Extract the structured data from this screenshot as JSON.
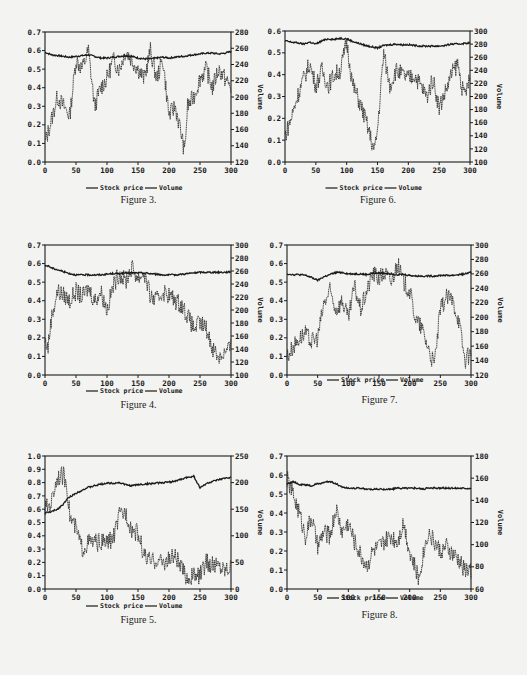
{
  "page": {
    "type": "scanned journal page with six dual-axis figures"
  },
  "legend": {
    "price_label": "Stock price",
    "volume_label": "Volume"
  },
  "figures": [
    {
      "id": "fig3",
      "caption": "Figure 3.",
      "left_ticks": [
        "0.0",
        "0.1",
        "0.2",
        "0.3",
        "0.4",
        "0.5",
        "0.6",
        "0.7"
      ],
      "right_ticks": [
        "120",
        "140",
        "160",
        "180",
        "200",
        "220",
        "240",
        "260",
        "280"
      ],
      "x_ticks": [
        "0",
        "50",
        "100",
        "150",
        "200",
        "250",
        "300"
      ],
      "right_axis_title": "Volume"
    },
    {
      "id": "fig6",
      "caption": "Figure 6.",
      "left_ticks": [
        "0.0",
        "0.1",
        "0.2",
        "0.3",
        "0.4",
        "0.5",
        "0.6"
      ],
      "right_ticks": [
        "100",
        "120",
        "140",
        "160",
        "180",
        "200",
        "220",
        "240",
        "260",
        "280",
        "300"
      ],
      "x_ticks": [
        "0",
        "50",
        "100",
        "150",
        "200",
        "250",
        "300"
      ],
      "right_axis_title": "Volume"
    },
    {
      "id": "fig4",
      "caption": "Figure 4.",
      "left_ticks": [
        "0.0",
        "0.1",
        "0.2",
        "0.3",
        "0.4",
        "0.5",
        "0.6",
        "0.7"
      ],
      "right_ticks": [
        "100",
        "120",
        "140",
        "160",
        "180",
        "200",
        "220",
        "240",
        "260",
        "280",
        "300"
      ],
      "x_ticks": [
        "0",
        "50",
        "100",
        "150",
        "200",
        "250",
        "300"
      ],
      "right_axis_title": "Volume"
    },
    {
      "id": "fig7",
      "caption": "Figure 7.",
      "left_ticks": [
        "0.0",
        "0.1",
        "0.2",
        "0.3",
        "0.4",
        "0.5",
        "0.6",
        "0.7"
      ],
      "right_ticks": [
        "120",
        "140",
        "160",
        "180",
        "200",
        "220",
        "240",
        "260",
        "280",
        "300"
      ],
      "x_ticks": [
        "0",
        "50",
        "100",
        "150",
        "200",
        "250",
        "300"
      ],
      "right_axis_title": "Volume"
    },
    {
      "id": "fig5",
      "caption": "Figure 5.",
      "left_ticks": [
        "0.0",
        "0.1",
        "0.2",
        "0.3",
        "0.4",
        "0.5",
        "0.6",
        "0.7",
        "0.8",
        "0.9",
        "1.0"
      ],
      "right_ticks": [
        "0",
        "50",
        "100",
        "150",
        "200",
        "250"
      ],
      "x_ticks": [
        "0",
        "50",
        "100",
        "150",
        "200",
        "250",
        "300"
      ],
      "right_axis_title": "Volume"
    },
    {
      "id": "fig8",
      "caption": "Figure 8.",
      "left_ticks": [
        "0.0",
        "0.1",
        "0.2",
        "0.3",
        "0.4",
        "0.5",
        "0.6",
        "0.7"
      ],
      "right_ticks": [
        "60",
        "80",
        "100",
        "120",
        "140",
        "160",
        "180"
      ],
      "x_ticks": [
        "0",
        "50",
        "100",
        "150",
        "200",
        "250",
        "300"
      ],
      "right_axis_title": "Volume"
    }
  ],
  "chart_data": [
    {
      "type": "line",
      "title": "Figure 3.",
      "xlabel": "",
      "ylabel": "",
      "y2label": "Volume",
      "xlim": [
        0,
        300
      ],
      "ylim": [
        0,
        0.7
      ],
      "y2lim": [
        120,
        280
      ],
      "grid": false,
      "legend_position": "bottom",
      "x": [
        0,
        10,
        20,
        30,
        40,
        50,
        60,
        70,
        80,
        90,
        100,
        110,
        120,
        130,
        140,
        150,
        160,
        170,
        180,
        190,
        200,
        210,
        220,
        225,
        230,
        240,
        250,
        260,
        270,
        280,
        290,
        300
      ],
      "series": [
        {
          "name": "Stock price",
          "axis": "left",
          "values": [
            0.1,
            0.22,
            0.35,
            0.3,
            0.25,
            0.55,
            0.5,
            0.6,
            0.3,
            0.4,
            0.45,
            0.55,
            0.5,
            0.6,
            0.55,
            0.5,
            0.45,
            0.6,
            0.45,
            0.55,
            0.25,
            0.3,
            0.15,
            0.05,
            0.3,
            0.35,
            0.45,
            0.5,
            0.4,
            0.5,
            0.45,
            0.4
          ]
        },
        {
          "name": "Volume",
          "axis": "right",
          "values": [
            255,
            252,
            251,
            250,
            249,
            250,
            251,
            252,
            250,
            248,
            248,
            249,
            250,
            251,
            250,
            248,
            247,
            247,
            248,
            249,
            248,
            249,
            250,
            250,
            251,
            252,
            253,
            254,
            254,
            253,
            254,
            256
          ]
        }
      ]
    },
    {
      "type": "line",
      "title": "Figure 6.",
      "xlabel": "",
      "ylabel": "",
      "y2label": "Volume",
      "xlim": [
        0,
        300
      ],
      "ylim": [
        0,
        0.6
      ],
      "y2lim": [
        100,
        300
      ],
      "grid": false,
      "legend_position": "bottom",
      "x": [
        0,
        10,
        20,
        30,
        40,
        50,
        60,
        70,
        80,
        90,
        100,
        110,
        120,
        130,
        140,
        145,
        150,
        160,
        170,
        180,
        190,
        200,
        210,
        220,
        230,
        240,
        250,
        260,
        270,
        280,
        290,
        300
      ],
      "series": [
        {
          "name": "Stock price",
          "axis": "left",
          "values": [
            0.12,
            0.2,
            0.3,
            0.38,
            0.45,
            0.35,
            0.42,
            0.35,
            0.4,
            0.42,
            0.55,
            0.35,
            0.28,
            0.2,
            0.1,
            0.05,
            0.15,
            0.5,
            0.35,
            0.42,
            0.4,
            0.38,
            0.4,
            0.35,
            0.3,
            0.38,
            0.25,
            0.32,
            0.4,
            0.45,
            0.3,
            0.38
          ]
        },
        {
          "name": "Volume",
          "axis": "right",
          "values": [
            285,
            283,
            282,
            280,
            283,
            280,
            285,
            288,
            287,
            289,
            288,
            284,
            281,
            278,
            276,
            275,
            274,
            278,
            279,
            280,
            279,
            279,
            278,
            277,
            277,
            277,
            277,
            278,
            280,
            280,
            281,
            282
          ]
        }
      ]
    },
    {
      "type": "line",
      "title": "Figure 4.",
      "xlabel": "",
      "ylabel": "",
      "y2label": "Volume",
      "xlim": [
        0,
        300
      ],
      "ylim": [
        0,
        0.7
      ],
      "y2lim": [
        100,
        300
      ],
      "grid": false,
      "legend_position": "bottom",
      "x": [
        0,
        5,
        10,
        20,
        30,
        40,
        50,
        60,
        70,
        80,
        90,
        100,
        110,
        120,
        130,
        140,
        150,
        160,
        170,
        180,
        190,
        200,
        210,
        220,
        230,
        240,
        250,
        260,
        270,
        280,
        290,
        300
      ],
      "series": [
        {
          "name": "Stock price",
          "axis": "left",
          "values": [
            0.18,
            0.15,
            0.3,
            0.45,
            0.43,
            0.4,
            0.45,
            0.42,
            0.47,
            0.4,
            0.45,
            0.35,
            0.48,
            0.55,
            0.5,
            0.58,
            0.52,
            0.55,
            0.42,
            0.4,
            0.45,
            0.43,
            0.4,
            0.38,
            0.32,
            0.25,
            0.28,
            0.25,
            0.15,
            0.1,
            0.12,
            0.15
          ]
        },
        {
          "name": "Volume",
          "axis": "right",
          "values": [
            268,
            268,
            265,
            262,
            259,
            256,
            254,
            254,
            254,
            254,
            254,
            255,
            256,
            256,
            257,
            257,
            257,
            257,
            256,
            255,
            254,
            254,
            254,
            255,
            256,
            257,
            258,
            258,
            258,
            258,
            258,
            259
          ]
        }
      ]
    },
    {
      "type": "line",
      "title": "Figure 7.",
      "xlabel": "",
      "ylabel": "",
      "y2label": "Volume",
      "xlim": [
        0,
        300
      ],
      "ylim": [
        0,
        0.7
      ],
      "y2lim": [
        120,
        300
      ],
      "grid": false,
      "legend_position": "bottom",
      "x": [
        0,
        10,
        20,
        30,
        40,
        50,
        60,
        70,
        80,
        90,
        100,
        110,
        120,
        130,
        140,
        150,
        160,
        170,
        180,
        190,
        200,
        210,
        220,
        230,
        240,
        250,
        260,
        270,
        280,
        290,
        300
      ],
      "series": [
        {
          "name": "Stock price",
          "axis": "left",
          "values": [
            0.1,
            0.15,
            0.2,
            0.22,
            0.18,
            0.2,
            0.38,
            0.45,
            0.35,
            0.4,
            0.3,
            0.48,
            0.35,
            0.45,
            0.55,
            0.52,
            0.55,
            0.5,
            0.6,
            0.5,
            0.45,
            0.3,
            0.25,
            0.15,
            0.05,
            0.35,
            0.42,
            0.4,
            0.3,
            0.08,
            0.12
          ]
        },
        {
          "name": "Volume",
          "axis": "right",
          "values": [
            260,
            259,
            259,
            258,
            255,
            251,
            256,
            259,
            262,
            262,
            260,
            260,
            260,
            259,
            261,
            261,
            261,
            260,
            259,
            259,
            258,
            257,
            257,
            257,
            257,
            258,
            258,
            258,
            259,
            260,
            262
          ]
        }
      ]
    },
    {
      "type": "line",
      "title": "Figure 5.",
      "xlabel": "",
      "ylabel": "",
      "y2label": "Volume",
      "xlim": [
        0,
        300
      ],
      "ylim": [
        0,
        1.0
      ],
      "y2lim": [
        0,
        250
      ],
      "grid": false,
      "legend_position": "bottom",
      "x": [
        0,
        10,
        20,
        30,
        35,
        40,
        50,
        60,
        70,
        80,
        90,
        100,
        110,
        120,
        130,
        140,
        150,
        160,
        170,
        180,
        190,
        200,
        210,
        220,
        230,
        240,
        250,
        260,
        270,
        280,
        290,
        300
      ],
      "series": [
        {
          "name": "Stock price",
          "axis": "left",
          "values": [
            0.6,
            0.65,
            0.85,
            0.85,
            0.8,
            0.55,
            0.45,
            0.3,
            0.35,
            0.35,
            0.35,
            0.35,
            0.38,
            0.55,
            0.58,
            0.45,
            0.42,
            0.25,
            0.2,
            0.22,
            0.2,
            0.22,
            0.25,
            0.15,
            0.08,
            0.1,
            0.1,
            0.2,
            0.18,
            0.18,
            0.15,
            0.18
          ]
        },
        {
          "name": "Volume",
          "axis": "right",
          "values": [
            143,
            145,
            150,
            160,
            168,
            173,
            180,
            186,
            191,
            194,
            197,
            199,
            199,
            200,
            196,
            194,
            196,
            197,
            198,
            199,
            200,
            201,
            203,
            206,
            210,
            212,
            190,
            198,
            202,
            205,
            208,
            210
          ]
        }
      ]
    },
    {
      "type": "line",
      "title": "Figure 8.",
      "xlabel": "",
      "ylabel": "",
      "y2label": "Volume",
      "xlim": [
        0,
        300
      ],
      "ylim": [
        0,
        0.7
      ],
      "y2lim": [
        60,
        180
      ],
      "grid": false,
      "legend_position": "bottom",
      "x": [
        0,
        10,
        20,
        30,
        40,
        50,
        60,
        70,
        80,
        90,
        100,
        110,
        120,
        130,
        140,
        150,
        160,
        170,
        180,
        190,
        200,
        210,
        215,
        220,
        230,
        240,
        250,
        260,
        270,
        280,
        290,
        300
      ],
      "series": [
        {
          "name": "Stock price",
          "axis": "left",
          "values": [
            0.58,
            0.5,
            0.4,
            0.28,
            0.38,
            0.22,
            0.3,
            0.28,
            0.42,
            0.3,
            0.35,
            0.25,
            0.18,
            0.12,
            0.2,
            0.22,
            0.25,
            0.28,
            0.25,
            0.35,
            0.2,
            0.1,
            0.05,
            0.15,
            0.3,
            0.25,
            0.2,
            0.22,
            0.18,
            0.15,
            0.1,
            0.1
          ]
        },
        {
          "name": "Volume",
          "axis": "right",
          "values": [
            155,
            157,
            154,
            154,
            153,
            155,
            156,
            157,
            155,
            152,
            151,
            151,
            151,
            150,
            150,
            150,
            150,
            150,
            151,
            151,
            151,
            151,
            151,
            150,
            151,
            151,
            151,
            151,
            151,
            151,
            151,
            151
          ]
        }
      ]
    }
  ]
}
